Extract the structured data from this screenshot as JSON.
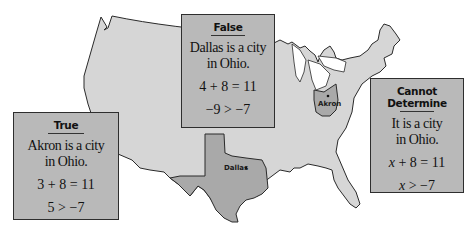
{
  "map": {
    "region": "Contiguous United States",
    "highlighted_states": [
      {
        "name": "Texas",
        "fill": "#a9a9a9"
      },
      {
        "name": "Ohio",
        "fill": "#a9a9a9"
      }
    ],
    "base_fill": "#d6d6d6",
    "outline": "#2a2a2a",
    "city_labels": [
      {
        "name": "Dallas",
        "state": "Texas"
      },
      {
        "name": "Akron",
        "state": "Ohio"
      }
    ]
  },
  "cards": [
    {
      "title": "True",
      "statement_line1": "Akron is a city",
      "statement_line2": "in Ohio.",
      "equation": "3 + 8 = 11",
      "inequality": "5 > −7"
    },
    {
      "title": "False",
      "statement_line1": "Dallas is a city",
      "statement_line2": "in Ohio.",
      "equation": "4 + 8 = 11",
      "inequality": "−9 > −7"
    },
    {
      "title": "Cannot Determine",
      "statement_line1": "It is a city",
      "statement_line2": "in Ohio.",
      "equation_var": "x",
      "equation_rest": " + 8 = 11",
      "inequality_var": "x",
      "inequality_rest": " > −7"
    }
  ],
  "colors": {
    "card_fill": "#b9b9b9",
    "card_border": "#2e2e2e",
    "land": "#d6d6d6",
    "highlight": "#a9a9a9"
  }
}
